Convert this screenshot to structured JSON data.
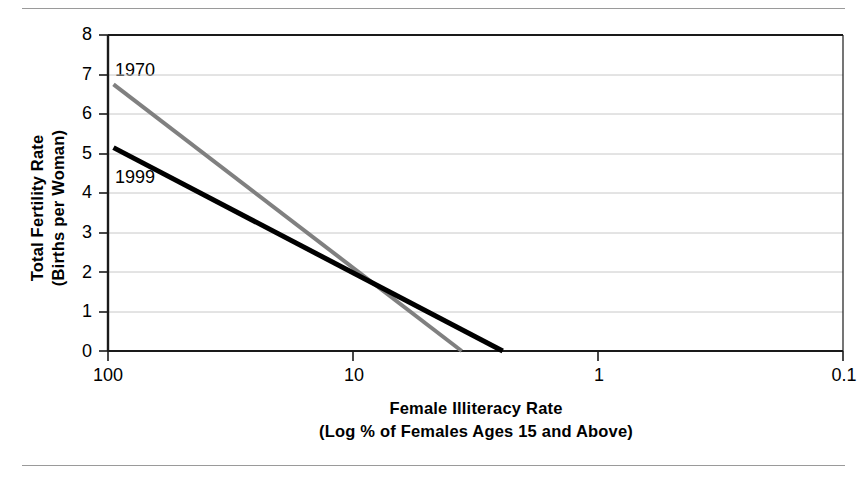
{
  "chart_data": {
    "type": "line",
    "title": "",
    "xlabel": "Female Illiteracy Rate",
    "xlabel_sub": "(Log % of Females Ages 15 and Above)",
    "ylabel": "Total Fertility Rate",
    "ylabel_sub": "(Births per Woman)",
    "x_scale": "log",
    "x_direction": "descending",
    "xlim": [
      100,
      0.1
    ],
    "ylim": [
      0,
      8
    ],
    "xticks": [
      "100",
      "10",
      "1",
      "0.1"
    ],
    "xtick_values": [
      100,
      10,
      1,
      0.1
    ],
    "yticks": [
      "0",
      "1",
      "2",
      "3",
      "4",
      "5",
      "6",
      "7",
      "8"
    ],
    "ytick_values": [
      0,
      1,
      2,
      3,
      4,
      5,
      6,
      7,
      8
    ],
    "grid": "horizontal",
    "grid_color": "#c8c8c8",
    "legend_position": "inline-annotation",
    "series": [
      {
        "name": "1970",
        "color": "#808080",
        "line_width": 4,
        "points": [
          {
            "x": 95.0,
            "y": 6.75
          },
          {
            "x": 3.6,
            "y": 0.0
          }
        ]
      },
      {
        "name": "1999",
        "color": "#000000",
        "line_width": 5,
        "points": [
          {
            "x": 95.0,
            "y": 5.15
          },
          {
            "x": 2.45,
            "y": 0.0
          }
        ]
      }
    ],
    "annotations": [
      {
        "text": "1970",
        "x_px": 115,
        "y_px": 61,
        "series": "1970"
      },
      {
        "text": "1999",
        "x_px": 115,
        "y_px": 168,
        "series": "1999"
      }
    ],
    "intersection": {
      "x": 1.1,
      "y": 0.95
    }
  },
  "frame": {
    "top_rule": "horizontal-rule",
    "bottom_rule": "horizontal-rule"
  }
}
